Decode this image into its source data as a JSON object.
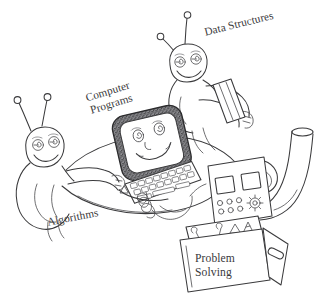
{
  "illustration": {
    "title": "Computer science concepts cartoon",
    "background_color": "#ffffff",
    "ink_color": "#3a3a3c",
    "style": "hand-drawn black-and-white line art"
  },
  "labels": {
    "data_structures": "Data Structures",
    "computer_programs": "Computer\nPrograms",
    "algorithms": "Algorithms",
    "problem_solving": "Problem\nSolving"
  },
  "scene": {
    "creatures": [
      {
        "name": "left-alien",
        "antennae": 2,
        "eyes": 2,
        "expression": "smiling",
        "associated_label": "Algorithms"
      },
      {
        "name": "upper-right-alien",
        "antennae": 2,
        "eyes": 2,
        "expression": "smiling",
        "associated_label": "Data Structures"
      }
    ],
    "computer": {
      "name": "smiling-computer",
      "screen_face": "smiling",
      "has_keyboard": true,
      "associated_label": "Computer Programs"
    },
    "machine": {
      "name": "problem-solving-machine",
      "display_windows": 2,
      "dial_circles": 6,
      "sun_dial": 1,
      "tool_glyphs": 4,
      "associated_label": "Problem Solving"
    },
    "cable": {
      "name": "coiled-cable",
      "coils": 5
    },
    "chute": {
      "name": "curved-chute-pipe"
    }
  }
}
